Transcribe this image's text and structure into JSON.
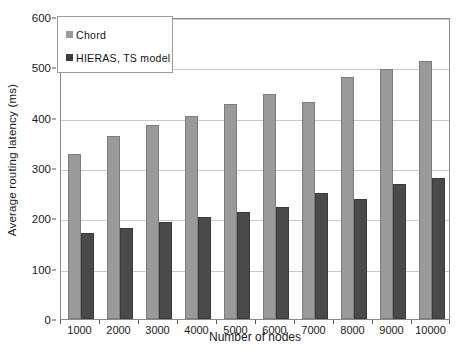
{
  "chart_data": {
    "type": "bar",
    "title": "",
    "xlabel": "Number of nodes",
    "ylabel": "Average routing latency (ms)",
    "categories": [
      "1000",
      "2000",
      "3000",
      "4000",
      "5000",
      "6000",
      "7000",
      "8000",
      "9000",
      "10000"
    ],
    "series": [
      {
        "name": "Chord",
        "color": "#9a9a9a",
        "values": [
          327,
          364,
          385,
          403,
          427,
          448,
          432,
          480,
          497,
          512
        ]
      },
      {
        "name": "HIERAS, TS model",
        "color": "#4a4a4a",
        "values": [
          170,
          181,
          193,
          203,
          212,
          222,
          251,
          239,
          268,
          280
        ]
      }
    ],
    "ylim": [
      0,
      600
    ],
    "yticks": [
      0,
      100,
      200,
      300,
      400,
      500,
      600
    ],
    "ytick_labels": [
      "0",
      "100",
      "200",
      "300",
      "400",
      "500",
      "600"
    ],
    "grid": true,
    "legend_position": "top-left"
  },
  "legend": {
    "items": [
      {
        "label": "Chord",
        "swatch": "legend-swatch-chord"
      },
      {
        "label": "HIERAS, TS model",
        "swatch": "legend-swatch-hieras"
      }
    ]
  }
}
